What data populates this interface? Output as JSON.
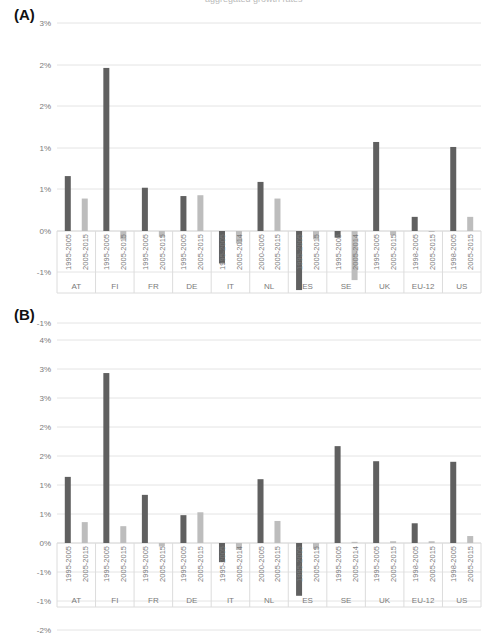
{
  "header": {
    "caption": "aggregated growth rates"
  },
  "colors": {
    "dark_bar": "#606060",
    "light_bar": "#bdbdbd",
    "grid": "#e4e4e4",
    "axis_text": "#7a7a7a",
    "frame": "#dcdcdc"
  },
  "chart_data": [
    {
      "type": "bar",
      "panel": "(A)",
      "title": "",
      "xlabel": "",
      "ylabel": "",
      "ylim": [
        -0.01,
        0.03
      ],
      "yticks": [
        0.03,
        0.025,
        0.02,
        0.015,
        0.01,
        0.005,
        0.0,
        -0.005
      ],
      "ytick_labels": [
        "3%",
        "2%",
        "2%",
        "1%",
        "1%",
        "0%",
        "-1%"
      ],
      "grid": true,
      "legend": null,
      "categories": [
        "AT",
        "FI",
        "FR",
        "DE",
        "IT",
        "NL",
        "ES",
        "SE",
        "UK",
        "EU-12",
        "US"
      ],
      "series": [
        {
          "name": "Early period",
          "color": "#606060",
          "periods": [
            "1995-2005",
            "1995-2005",
            "1995-2005",
            "1995-2005",
            "1995-2005",
            "2000-2005",
            "1995-2005",
            "1995-2005",
            "1995-2005",
            "1998-2005",
            "1998-2005"
          ],
          "values": [
            0.0066,
            0.0196,
            0.0052,
            0.0042,
            -0.0039,
            0.0059,
            -0.0071,
            -0.0008,
            0.0107,
            0.0017,
            0.0101
          ]
        },
        {
          "name": "Late period",
          "color": "#bdbdbd",
          "periods": [
            "2005-2015",
            "2005-2015",
            "2005-2015",
            "2005-2015",
            "2005-2014",
            "2005-2015",
            "2005-2015",
            "2005-2014",
            "2005-2015",
            "2005-2015",
            "2005-2015"
          ],
          "values": [
            0.0039,
            -0.001,
            -0.0007,
            0.0043,
            -0.0015,
            0.0039,
            -0.001,
            -0.0059,
            -0.0005,
            -0.0001,
            0.0017
          ]
        }
      ]
    },
    {
      "type": "bar",
      "panel": "(B)",
      "title": "",
      "xlabel": "",
      "ylabel": "",
      "ylim": [
        -0.02,
        0.04
      ],
      "yticks": [
        0.04,
        0.035,
        0.03,
        0.025,
        0.02,
        0.015,
        0.01,
        0.005,
        0.0,
        -0.005,
        -0.01,
        -0.015
      ],
      "ytick_labels": [
        "-1%",
        "4%",
        "3%",
        "3%",
        "2%",
        "2%",
        "1%",
        "1%",
        "0%",
        "-1%",
        "-1%",
        "-2%"
      ],
      "grid": true,
      "legend": null,
      "categories": [
        "AT",
        "FI",
        "FR",
        "DE",
        "IT",
        "NL",
        "ES",
        "SE",
        "UK",
        "EU-12",
        "US"
      ],
      "series": [
        {
          "name": "Early period",
          "color": "#606060",
          "periods": [
            "1995-2005",
            "1995-2005",
            "1995-2005",
            "1995-2005",
            "1995-2005",
            "2000-2005",
            "1995-2005",
            "1995-2005",
            "1995-2005",
            "1998-2005",
            "1998-2005"
          ],
          "values": [
            0.0114,
            0.0293,
            0.0083,
            0.0048,
            -0.0033,
            0.011,
            -0.0091,
            0.0167,
            0.0141,
            0.0034,
            0.014
          ]
        },
        {
          "name": "Late period",
          "color": "#bdbdbd",
          "periods": [
            "2005-2015",
            "2005-2015",
            "2005-2015",
            "2005-2015",
            "2005-2014",
            "2005-2015",
            "2005-2015",
            "2005-2014",
            "2005-2015",
            "2005-2015",
            "2005-2015"
          ],
          "values": [
            0.0036,
            0.0029,
            -0.0006,
            0.0053,
            -0.0012,
            0.0038,
            -0.001,
            0.0002,
            0.0003,
            0.0003,
            0.0012
          ]
        }
      ]
    }
  ],
  "panels": [
    {
      "label": "(A)",
      "top_y": 23,
      "zero_y": 231,
      "px_per_half_pct": 41.6,
      "grid": [
        {
          "y": 23,
          "label": "3%"
        },
        {
          "y": 65,
          "label": "2%"
        },
        {
          "y": 106,
          "label": "2%"
        },
        {
          "y": 148,
          "label": "1%"
        },
        {
          "y": 189,
          "label": "1%"
        },
        {
          "y": 231,
          "label": "0%"
        },
        {
          "y": 272,
          "label": "-1%"
        }
      ],
      "axis_bottom": 293,
      "period_label_y": 272,
      "country_label_y": 287
    },
    {
      "label": "(B)",
      "top_y": 323,
      "zero_y": 543,
      "px_per_half_pct": 29,
      "grid": [
        {
          "y": 323,
          "label": "-1%"
        },
        {
          "y": 340,
          "label": "4%"
        },
        {
          "y": 369,
          "label": "3%"
        },
        {
          "y": 398,
          "label": "3%"
        },
        {
          "y": 427,
          "label": "2%"
        },
        {
          "y": 456,
          "label": "2%"
        },
        {
          "y": 485,
          "label": "1%"
        },
        {
          "y": 514,
          "label": "1%"
        },
        {
          "y": 543,
          "label": "0%"
        },
        {
          "y": 572,
          "label": "-1%"
        },
        {
          "y": 601,
          "label": "-1%"
        },
        {
          "y": 630,
          "label": "-2%"
        }
      ],
      "axis_bottom": 607,
      "period_label_y": 584,
      "country_label_y": 601
    }
  ]
}
